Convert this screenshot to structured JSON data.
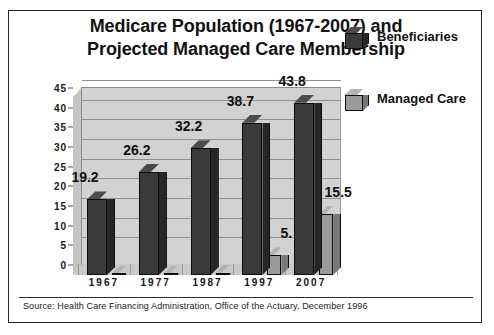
{
  "chart_data": {
    "type": "bar",
    "title": "Medicare Population (1967-2007) and Projected Managed Care Membership",
    "title_lines": [
      "Medicare Population (1967-2007) and",
      "Projected Managed Care Membership"
    ],
    "xlabel": "",
    "ylabel": "",
    "ylim": [
      0,
      45
    ],
    "yticks": [
      0,
      5,
      10,
      15,
      20,
      25,
      30,
      35,
      40,
      45
    ],
    "ytick_labels": [
      "0",
      "5",
      "10",
      "15",
      "20",
      "25",
      "30",
      "35",
      "40",
      "45"
    ],
    "grid": true,
    "legend_position": "right",
    "categories": [
      "1967",
      "1977",
      "1987",
      "1997",
      "2007"
    ],
    "series": [
      {
        "name": "Beneficiaries",
        "color": "#3a3a3a",
        "values": [
          19.2,
          26.2,
          32.2,
          38.7,
          43.8
        ],
        "labels": [
          "19.2",
          "26.2",
          "32.2",
          "38.7",
          "43.8"
        ]
      },
      {
        "name": "Managed Care",
        "color": "#9b9b9b",
        "values": [
          0.3,
          0.4,
          0.6,
          5.0,
          15.5
        ],
        "labels": [
          "",
          "",
          "",
          "5.",
          "15.5"
        ]
      }
    ],
    "source_note": "Source:  Health Care Financing Administration, Office of the Actuary, December 1996"
  },
  "legend": {
    "entries": [
      {
        "label": "Beneficiaries",
        "swatch": "dark-cube-icon"
      },
      {
        "label": "Managed Care",
        "swatch": "light-cube-icon"
      }
    ]
  },
  "colors": {
    "beneficiaries": "#3a3a3a",
    "managed_care": "#9b9b9b",
    "plot_wall": "#d2d2d2",
    "frame_border": "#262626",
    "text": "#101010"
  }
}
